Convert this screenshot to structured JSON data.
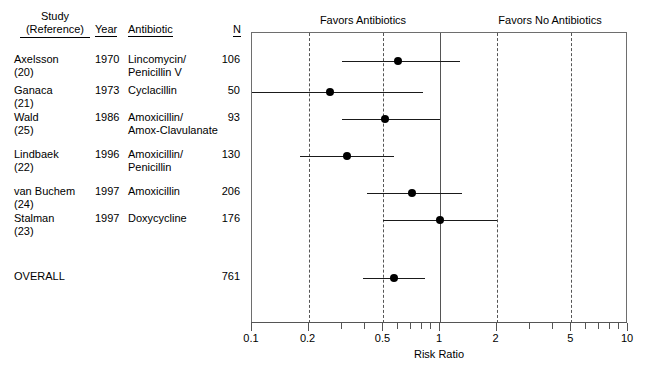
{
  "table": {
    "headers": {
      "study": "Study",
      "study_sub": "(Reference)",
      "year": "Year",
      "antibiotic": "Antibiotic",
      "n": "N"
    },
    "rows": [
      {
        "study": "Axelsson",
        "ref": "(20)",
        "year": "1970",
        "antibiotic_l1": "Lincomycin/",
        "antibiotic_l2": "Penicillin V",
        "n": "106"
      },
      {
        "study": "Ganaca",
        "ref": "(21)",
        "year": "1973",
        "antibiotic_l1": "Cyclacillin",
        "antibiotic_l2": "",
        "n": "50"
      },
      {
        "study": "Wald",
        "ref": "(25)",
        "year": "1986",
        "antibiotic_l1": "Amoxicillin/",
        "antibiotic_l2": "Amox-Clavulanate",
        "n": "93"
      },
      {
        "study": "Lindbaek",
        "ref": "(22)",
        "year": "1996",
        "antibiotic_l1": "Amoxicillin/",
        "antibiotic_l2": "Penicillin",
        "n": "130"
      },
      {
        "study": "van Buchem",
        "ref": "(24)",
        "year": "1997",
        "antibiotic_l1": "Amoxicillin",
        "antibiotic_l2": "",
        "n": "206"
      },
      {
        "study": "Stalman",
        "ref": "(23)",
        "year": "1997",
        "antibiotic_l1": "Doxycycline",
        "antibiotic_l2": "",
        "n": "176"
      },
      {
        "study": "OVERALL",
        "ref": "",
        "year": "",
        "antibiotic_l1": "",
        "antibiotic_l2": "",
        "n": "761"
      }
    ]
  },
  "plot": {
    "favors_left": "Favors Antibiotics",
    "favors_right": "Favors No Antibiotics",
    "axis_title": "Risk Ratio"
  },
  "chart_data": {
    "type": "forest",
    "title": "",
    "xlabel": "Risk Ratio",
    "ylabel": "",
    "xscale": "log",
    "xlim": [
      0.1,
      10
    ],
    "grid": true,
    "null_line": 1,
    "tick_labels": [
      "0.1",
      "0.2",
      "0.5",
      "1",
      "2",
      "5",
      "10"
    ],
    "tick_values": [
      0.1,
      0.2,
      0.5,
      1,
      2,
      5,
      10
    ],
    "minor_ticks": [
      0.3,
      0.4,
      0.6,
      0.7,
      0.8,
      0.9,
      3,
      4,
      6,
      7,
      8,
      9
    ],
    "gridline_values": [
      0.2,
      0.5,
      2,
      5
    ],
    "legend": [
      "Favors Antibiotics",
      "Favors No Antibiotics"
    ],
    "points": [
      {
        "label": "Axelsson",
        "year": 1970,
        "n": 106,
        "rr": 0.6,
        "ci_low": 0.3,
        "ci_high": 1.27,
        "clipped_low": false,
        "clipped_high": false
      },
      {
        "label": "Ganaca",
        "year": 1973,
        "n": 50,
        "rr": 0.26,
        "ci_low": 0.1,
        "ci_high": 0.81,
        "clipped_low": true,
        "clipped_high": false
      },
      {
        "label": "Wald",
        "year": 1986,
        "n": 93,
        "rr": 0.51,
        "ci_low": 0.3,
        "ci_high": 1.0,
        "clipped_low": false,
        "clipped_high": false
      },
      {
        "label": "Lindbaek",
        "year": 1996,
        "n": 130,
        "rr": 0.32,
        "ci_low": 0.18,
        "ci_high": 0.57,
        "clipped_low": false,
        "clipped_high": false
      },
      {
        "label": "van Buchem",
        "year": 1997,
        "n": 206,
        "rr": 0.71,
        "ci_low": 0.41,
        "ci_high": 1.31,
        "clipped_low": false,
        "clipped_high": false
      },
      {
        "label": "Stalman",
        "year": 1997,
        "n": 176,
        "rr": 1.0,
        "ci_low": 0.5,
        "ci_high": 2.0,
        "clipped_low": false,
        "clipped_high": false
      },
      {
        "label": "OVERALL",
        "year": null,
        "n": 761,
        "rr": 0.57,
        "ci_low": 0.39,
        "ci_high": 0.83,
        "clipped_low": false,
        "clipped_high": false
      }
    ],
    "row_y": [
      60,
      91,
      118,
      155,
      192,
      219,
      277
    ]
  }
}
